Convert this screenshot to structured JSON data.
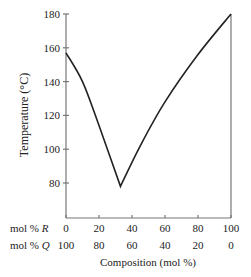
{
  "chart_data": {
    "type": "line",
    "title": "",
    "xlabel": "Composition (mol %)",
    "ylabel": "Temperature (°C)",
    "xlim": [
      0,
      100
    ],
    "ylim": [
      60,
      180
    ],
    "grid": false,
    "legend": null,
    "y_ticks": [
      80,
      100,
      120,
      140,
      160,
      180
    ],
    "x_ticks_R": [
      0,
      20,
      40,
      60,
      80,
      100
    ],
    "x_ticks_Q": [
      100,
      80,
      60,
      40,
      20,
      0
    ],
    "x_row_labels": {
      "R": "mol % R",
      "Q": "mol % Q"
    },
    "series": [
      {
        "name": "Liquidus",
        "x": [
          0,
          10,
          20,
          33,
          45,
          60,
          80,
          100
        ],
        "y": [
          157,
          140,
          114,
          78,
          102,
          128,
          156,
          180
        ]
      }
    ],
    "annotations": [
      "Eutectic minimum at ~33 mol % R, ~78 °C"
    ]
  },
  "labels": {
    "ylabel": "Temperature (°C)",
    "xlabel": "Composition (mol %)",
    "row_R_prefix": "mol % ",
    "row_R_var": "R",
    "row_Q_prefix": "mol % ",
    "row_Q_var": "Q"
  }
}
